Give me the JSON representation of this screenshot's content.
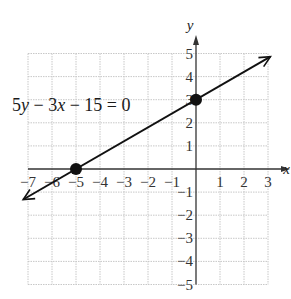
{
  "chart_data": {
    "type": "line",
    "title": "",
    "equation": "5y − 3x − 15 = 0",
    "equation_parts": [
      "5",
      "y",
      " − 3",
      "x",
      " − 15 = 0"
    ],
    "xlabel": "x",
    "ylabel": "y",
    "xlim": [
      -7,
      3
    ],
    "ylim": [
      -5,
      5
    ],
    "grid": true,
    "x_ticks": [
      "−7",
      "−6",
      "−5",
      "−4",
      "−3",
      "−2",
      "−1",
      "1",
      "2",
      "3"
    ],
    "y_ticks": [
      "5",
      "4",
      "3",
      "2",
      "1",
      "−1",
      "−2",
      "−3",
      "−4",
      "−5"
    ],
    "series": [
      {
        "name": "5y − 3x − 15 = 0",
        "slope": 0.6,
        "intercept": 3,
        "x": [
          -7.2,
          3.1
        ],
        "y": [
          -1.32,
          4.86
        ]
      }
    ],
    "points": [
      {
        "label": "x-intercept",
        "x": -5,
        "y": 0
      },
      {
        "label": "y-intercept",
        "x": 0,
        "y": 3
      }
    ]
  },
  "colors": {
    "grid": "#c8c8c8",
    "axis": "#333333",
    "line": "#111111",
    "point": "#111111"
  }
}
